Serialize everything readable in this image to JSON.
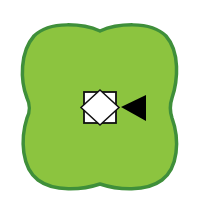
{
  "canvas": {
    "width": 200,
    "height": 214,
    "background": "#ffffff"
  },
  "blob": {
    "shape": "four-lobed-rounded-blob",
    "fill": "#8cc43f",
    "stroke": "#3f8f3a"
  },
  "marker": {
    "box_icon": "square-with-inscribed-diamond-icon",
    "box_fill": "#ffffff",
    "box_stroke": "#111111",
    "arrow_icon": "left-pointing-triangle-icon",
    "arrow_fill": "#000000"
  }
}
